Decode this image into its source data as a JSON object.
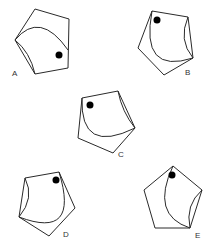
{
  "figures": [
    {
      "label": "A",
      "pentagon": "35,9 69,19 68,68 35,74 15,40",
      "arc": "M15,40 Q40,10 68,50",
      "inner_arc": "M15,40 Q30,52 35,74",
      "dot": {
        "cx": 59,
        "cy": 55,
        "r": 3.5
      },
      "label_pos": {
        "x": 12,
        "y": 70
      }
    },
    {
      "label": "B",
      "pentagon": "152,11 188,17 193,58 164,75 138,48",
      "arc": "M152,11 Q140,75 193,58",
      "inner_arc": "M188,17 Q178,40 193,58",
      "dot": {
        "cx": 157,
        "cy": 20,
        "r": 3.5
      },
      "label_pos": {
        "x": 185,
        "y": 69
      }
    },
    {
      "label": "C",
      "pentagon": "82,98 118,91 135,128 113,153 78,138",
      "arc": "M82,98 Q80,155 135,128",
      "inner_arc": "M118,91 Q122,112 135,128",
      "dot": {
        "cx": 90,
        "cy": 105,
        "r": 3.5
      },
      "label_pos": {
        "x": 118,
        "y": 151
      }
    },
    {
      "label": "D",
      "pentagon": "25,178 59,172 75,208 49,236 19,217",
      "arc": "M59,172 Q80,240 19,217",
      "inner_arc": "M25,178 Q35,198 19,217",
      "dot": {
        "cx": 56,
        "cy": 180,
        "r": 3.5
      },
      "label_pos": {
        "x": 63,
        "y": 231
      }
    },
    {
      "label": "E",
      "pentagon": "173,166 202,190 190,228 155,228 144,190",
      "arc": "M173,166 Q150,215 190,228",
      "inner_arc": "M202,190 Q185,205 190,228",
      "dot": {
        "cx": 172,
        "cy": 175,
        "r": 3.5
      },
      "label_pos": {
        "x": 195,
        "y": 232
      }
    }
  ]
}
